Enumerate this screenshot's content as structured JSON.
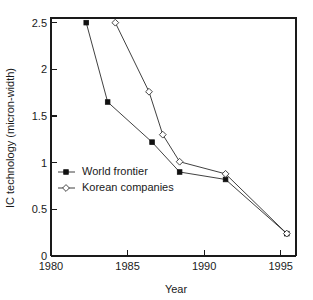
{
  "chart_data": {
    "type": "line",
    "title": "",
    "xlabel": "Year",
    "ylabel": "IC technology (micron-width)",
    "xlim": [
      1980,
      1996
    ],
    "ylim": [
      0,
      2.55
    ],
    "xticks": [
      1980,
      1985,
      1990,
      1995
    ],
    "xtick_labels": [
      "1980",
      "1985",
      "1990",
      "1995"
    ],
    "yticks": [
      0,
      0.5,
      1,
      1.5,
      2,
      2.5
    ],
    "ytick_labels": [
      "0",
      "0.5",
      "1",
      "1.5",
      "2",
      "2.5"
    ],
    "grid": false,
    "legend_position": "center-left",
    "series": [
      {
        "name": "World frontier",
        "marker": "filled-square",
        "points": [
          {
            "x": 1982.3,
            "y": 2.5
          },
          {
            "x": 1983.7,
            "y": 1.65
          },
          {
            "x": 1986.6,
            "y": 1.22
          },
          {
            "x": 1988.4,
            "y": 0.9
          },
          {
            "x": 1991.4,
            "y": 0.82
          },
          {
            "x": 1995.4,
            "y": 0.24
          }
        ]
      },
      {
        "name": "Korean companies",
        "marker": "open-diamond",
        "points": [
          {
            "x": 1984.2,
            "y": 2.5
          },
          {
            "x": 1986.4,
            "y": 1.76
          },
          {
            "x": 1987.3,
            "y": 1.3
          },
          {
            "x": 1988.4,
            "y": 1.01
          },
          {
            "x": 1991.4,
            "y": 0.88
          },
          {
            "x": 1995.4,
            "y": 0.24
          }
        ]
      }
    ]
  },
  "legend": {
    "entries": [
      {
        "label": "World frontier",
        "marker": "filled-square"
      },
      {
        "label": "Korean companies",
        "marker": "open-diamond"
      }
    ]
  },
  "colors": {
    "axis": "#1a1a1a",
    "line": "#2b2b2b",
    "marker_fill": "#111111",
    "marker_open_fill": "#ffffff",
    "background": "#ffffff"
  }
}
